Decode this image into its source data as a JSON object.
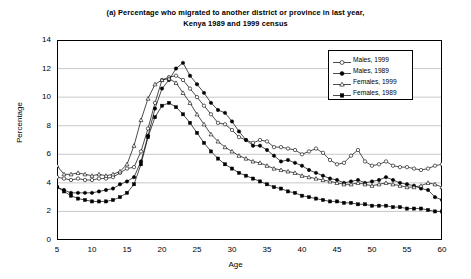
{
  "chart_data": {
    "type": "line",
    "title": "(a) Percentage who migrated to another district or province in last year,",
    "subtitle": "Kenya 1989 and 1999 census",
    "xlabel": "Age",
    "ylabel": "Percentage",
    "xlim": [
      5,
      60
    ],
    "ylim": [
      0,
      14
    ],
    "xticks": [
      5,
      10,
      15,
      20,
      25,
      30,
      35,
      40,
      45,
      50,
      55,
      60
    ],
    "yticks": [
      0,
      2,
      4,
      6,
      8,
      10,
      12,
      14
    ],
    "grid": "horizontal",
    "legend_position": "top-right",
    "x": [
      5,
      6,
      7,
      8,
      9,
      10,
      11,
      12,
      13,
      14,
      15,
      16,
      17,
      18,
      19,
      20,
      21,
      22,
      23,
      24,
      25,
      26,
      27,
      28,
      29,
      30,
      31,
      32,
      33,
      34,
      35,
      36,
      37,
      38,
      39,
      40,
      41,
      42,
      43,
      44,
      45,
      46,
      47,
      48,
      49,
      50,
      51,
      52,
      53,
      54,
      55,
      56,
      57,
      58,
      59,
      60
    ],
    "series": [
      {
        "name": "Males, 1999",
        "marker": "open-circle",
        "values": [
          4.4,
          4.3,
          4.2,
          4.3,
          4.2,
          4.2,
          4.3,
          4.3,
          4.4,
          4.7,
          5.0,
          5.1,
          6.2,
          7.8,
          9.6,
          11.2,
          11.4,
          11.5,
          11.2,
          10.6,
          10.0,
          9.4,
          8.8,
          8.2,
          8.1,
          7.7,
          7.2,
          7.0,
          6.8,
          7.0,
          6.9,
          6.5,
          6.5,
          6.4,
          6.3,
          6.0,
          6.2,
          6.4,
          6.1,
          5.6,
          5.3,
          5.4,
          5.9,
          6.3,
          5.5,
          5.2,
          5.3,
          5.5,
          5.2,
          5.1,
          5.1,
          5.0,
          4.9,
          5.0,
          5.2,
          5.3
        ]
      },
      {
        "name": "Males, 1989",
        "marker": "filled-circle",
        "values": [
          3.7,
          3.5,
          3.3,
          3.3,
          3.3,
          3.3,
          3.4,
          3.5,
          3.6,
          3.9,
          4.1,
          4.4,
          5.5,
          7.3,
          9.2,
          10.6,
          11.2,
          12.0,
          12.4,
          11.5,
          10.9,
          10.3,
          9.6,
          9.1,
          8.9,
          8.3,
          7.6,
          7.0,
          6.6,
          6.6,
          6.3,
          5.9,
          5.5,
          5.6,
          5.4,
          5.2,
          4.9,
          4.7,
          4.5,
          4.3,
          4.2,
          4.0,
          4.1,
          4.2,
          4.0,
          4.1,
          4.2,
          4.4,
          4.2,
          4.0,
          3.9,
          3.8,
          3.6,
          3.5,
          3.0,
          2.8
        ]
      },
      {
        "name": "Females, 1999",
        "marker": "open-triangle",
        "values": [
          5.2,
          4.6,
          4.6,
          4.7,
          4.6,
          4.5,
          4.6,
          4.5,
          4.6,
          4.8,
          5.3,
          6.6,
          8.4,
          9.9,
          10.9,
          11.2,
          11.3,
          11.0,
          10.3,
          9.6,
          8.8,
          8.1,
          7.4,
          6.9,
          6.5,
          6.2,
          5.9,
          5.7,
          5.5,
          5.4,
          5.2,
          5.0,
          4.9,
          4.8,
          4.7,
          4.5,
          4.4,
          4.3,
          4.2,
          4.1,
          4.0,
          3.9,
          3.9,
          4.0,
          3.9,
          3.8,
          3.9,
          4.0,
          3.9,
          3.8,
          3.7,
          3.7,
          3.8,
          4.0,
          3.9,
          3.7
        ]
      },
      {
        "name": "Females, 1989",
        "marker": "filled-square",
        "values": [
          3.7,
          3.4,
          3.1,
          2.9,
          2.8,
          2.7,
          2.7,
          2.7,
          2.8,
          3.0,
          3.3,
          3.9,
          5.3,
          7.2,
          8.6,
          9.4,
          9.6,
          9.3,
          8.8,
          8.2,
          7.5,
          6.8,
          6.2,
          5.7,
          5.3,
          5.0,
          4.7,
          4.5,
          4.3,
          4.1,
          3.9,
          3.7,
          3.6,
          3.4,
          3.3,
          3.1,
          3.0,
          2.9,
          2.8,
          2.7,
          2.7,
          2.6,
          2.6,
          2.5,
          2.5,
          2.4,
          2.4,
          2.4,
          2.3,
          2.3,
          2.2,
          2.2,
          2.2,
          2.1,
          2.0,
          2.0
        ]
      }
    ]
  }
}
